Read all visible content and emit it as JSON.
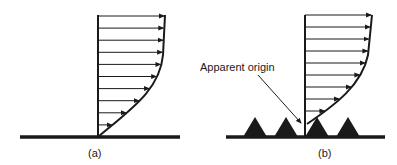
{
  "panels": [
    {
      "id": "a",
      "caption": "(a)",
      "surface": "smooth",
      "arrow_count": 10
    },
    {
      "id": "b",
      "caption": "(b)",
      "surface": "rough",
      "arrow_count": 9,
      "roughness_elements": 4,
      "annotation": "Apparent origin"
    }
  ],
  "colors": {
    "ink": "#1a1a1a",
    "background": "#ffffff"
  }
}
